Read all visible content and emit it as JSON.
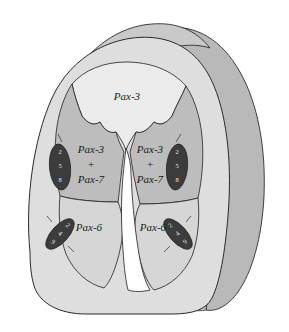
{
  "figure": {
    "type": "anatomical-schematic"
  },
  "colors": {
    "background": "#ffffff",
    "outer_mantle": "#dedede",
    "receding_surface": "#b9b9b9",
    "top_rim": "#c9c9c9",
    "dorsal_roof": "#ebebeb",
    "alar_plate": "#bdbdbd",
    "basal_plate": "#d6d6d6",
    "lumen": "#ffffff",
    "nodule_fill": "#3c3c3c",
    "outline": "#2b2b2b",
    "label_text": "#1a1a1a",
    "nodule_text": "#e8e8e8"
  },
  "regions": [
    {
      "id": "dorsal-roof",
      "name": "dorsal-roof-plate",
      "label": "Pax-3",
      "label_lines": [
        "Pax-3"
      ]
    },
    {
      "id": "alar-left",
      "name": "alar-plate-left",
      "label": "Pax-3 + Pax-7",
      "label_lines": [
        "Pax-3",
        "+",
        "Pax-7"
      ]
    },
    {
      "id": "alar-right",
      "name": "alar-plate-right",
      "label": "Pax-3 + Pax-7",
      "label_lines": [
        "Pax-3",
        "+",
        "Pax-7"
      ]
    },
    {
      "id": "basal-left",
      "name": "basal-plate-left",
      "label": "Pax-6",
      "label_lines": [
        "Pax-6"
      ]
    },
    {
      "id": "basal-right",
      "name": "basal-plate-right",
      "label": "Pax-6",
      "label_lines": [
        "Pax-6"
      ]
    }
  ],
  "labels": {
    "dorsal": "Pax-3",
    "alar_line1": "Pax-3",
    "alar_plus": "+",
    "alar_line3": "Pax-7",
    "basal": "Pax-6"
  },
  "nodules": [
    {
      "id": "nodule-upper-left",
      "name": "nodule-upper-left",
      "digits": [
        "2",
        "5",
        "8"
      ],
      "text": "258"
    },
    {
      "id": "nodule-upper-right",
      "name": "nodule-upper-right",
      "digits": [
        "2",
        "5",
        "8"
      ],
      "text": "258"
    },
    {
      "id": "nodule-lower-left",
      "name": "nodule-lower-left",
      "digits": [
        "2",
        "4",
        "9"
      ],
      "text": "249"
    },
    {
      "id": "nodule-lower-right",
      "name": "nodule-lower-right",
      "digits": [
        "2",
        "4",
        "9"
      ],
      "text": "249"
    }
  ]
}
